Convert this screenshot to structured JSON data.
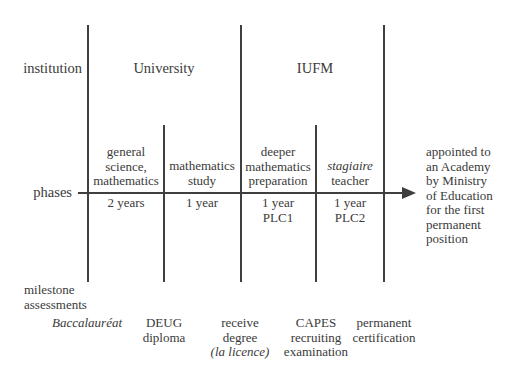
{
  "row_labels": {
    "institution": "institution",
    "phases": "phases",
    "milestone_line1": "milestone",
    "milestone_line2": "assessments"
  },
  "institutions": [
    {
      "label": "University"
    },
    {
      "label": "IUFM"
    }
  ],
  "phases": [
    {
      "line1": "general",
      "line2": "science,",
      "line3": "mathematics",
      "duration1": "2 years",
      "duration2": ""
    },
    {
      "line1": "",
      "line2": "mathematics",
      "line3": "study",
      "duration1": "1 year",
      "duration2": ""
    },
    {
      "line1": "deeper",
      "line2": "mathematics",
      "line3": "preparation",
      "duration1": "1 year",
      "duration2": "PLC1"
    },
    {
      "line1": "",
      "line2": "stagiaire",
      "line3": "teacher",
      "duration1": "1 year",
      "duration2": "PLC2"
    }
  ],
  "outcome": {
    "lines": [
      "appointed to",
      "an Academy",
      "by Ministry",
      "of Education",
      "for the first",
      "permanent",
      "position"
    ]
  },
  "milestones": [
    {
      "lines": [
        "Baccalauréat"
      ],
      "italic": [
        true
      ]
    },
    {
      "lines": [
        "DEUG",
        "diploma"
      ],
      "italic": [
        false,
        false
      ]
    },
    {
      "lines": [
        "receive",
        "degree",
        "(la licence)"
      ],
      "italic": [
        false,
        false,
        true
      ]
    },
    {
      "lines": [
        "CAPES",
        "recruiting",
        "examination"
      ],
      "italic": [
        false,
        false,
        false
      ]
    },
    {
      "lines": [
        "permanent",
        "certification"
      ],
      "italic": [
        false,
        false
      ]
    }
  ],
  "colors": {
    "line": "#3f3f3f",
    "text": "#3a3a3a",
    "background": "#ffffff"
  }
}
